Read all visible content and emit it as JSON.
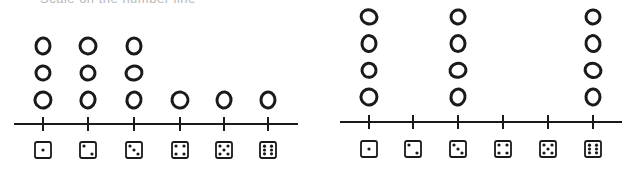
{
  "title": "Scale on the number line",
  "chart_data": [
    {
      "type": "dot-plot",
      "title": "",
      "categories": [
        "1",
        "2",
        "3",
        "4",
        "5",
        "6"
      ],
      "category_icons": [
        "die-face-1",
        "die-face-2",
        "die-face-3",
        "die-face-4",
        "die-face-5",
        "die-face-6"
      ],
      "values": [
        3,
        3,
        3,
        1,
        1,
        1
      ],
      "xlabel": "",
      "ylabel": "",
      "grid": false
    },
    {
      "type": "dot-plot",
      "title": "",
      "categories": [
        "1",
        "2",
        "3",
        "4",
        "5",
        "6"
      ],
      "category_icons": [
        "die-face-1",
        "die-face-2",
        "die-face-3",
        "die-face-4",
        "die-face-5",
        "die-face-6"
      ],
      "values": [
        4,
        0,
        4,
        0,
        0,
        4
      ],
      "xlabel": "",
      "ylabel": "",
      "grid": false
    }
  ],
  "layout": {
    "plots": [
      {
        "axis_y": 124,
        "x_start": 14,
        "x_end": 298,
        "ticks": [
          43,
          88,
          134,
          180,
          224,
          268
        ],
        "mark_spacing": 27,
        "first_mark_y": 100,
        "die_y": 150
      },
      {
        "axis_y": 122,
        "x_start": 340,
        "x_end": 622,
        "ticks": [
          369,
          413,
          458,
          503,
          548,
          593
        ],
        "mark_spacing": 26.7,
        "first_mark_y": 97,
        "die_y": 149
      }
    ],
    "stroke": "#1a1a1a"
  }
}
